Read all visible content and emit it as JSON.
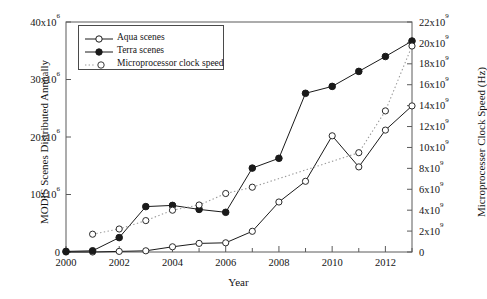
{
  "chart_data": {
    "type": "line",
    "title": "",
    "xlabel": "Year",
    "ylabel": "MODIS Scenes Distributed Annually",
    "ylabel_right": "Microprocesser Clock Speed (Hz)",
    "x": [
      2000,
      2001,
      2002,
      2003,
      2004,
      2005,
      2006,
      2007,
      2008,
      2009,
      2010,
      2011,
      2012,
      2013
    ],
    "xlim": [
      2000,
      2013
    ],
    "xticks": [
      2000,
      2002,
      2004,
      2006,
      2008,
      2010,
      2012
    ],
    "xticklabels": [
      "2000",
      "2002",
      "2004",
      "2006",
      "2008",
      "2010",
      "2012"
    ],
    "xminorticks": [
      2001,
      2003,
      2005,
      2007,
      2009,
      2011,
      2013
    ],
    "ylim": [
      0,
      40000000
    ],
    "yticks": [
      0,
      10000000,
      20000000,
      30000000,
      40000000
    ],
    "yticklabels": [
      "0",
      "10x10",
      "20x10",
      "30x10",
      "40x10"
    ],
    "ytick_exponent": "6",
    "ylim_right": [
      0,
      22000000000
    ],
    "yticks_right": [
      0,
      2000000000,
      4000000000,
      6000000000,
      8000000000,
      10000000000,
      12000000000,
      14000000000,
      16000000000,
      18000000000,
      20000000000,
      22000000000
    ],
    "yticklabels_right": [
      "0",
      "2x10",
      "4x10",
      "6x10",
      "8x10",
      "10x10",
      "12x10",
      "14x10",
      "16x10",
      "18x10",
      "20x10",
      "22x10"
    ],
    "ytick_right_exponent": "9",
    "grid": false,
    "legend_position": "upper left",
    "series": [
      {
        "name": "Aqua scenes",
        "axis": "left",
        "marker": "open-circle",
        "linestyle": "solid",
        "color": "#1a1a1a",
        "x": [
          2000,
          2001,
          2002,
          2003,
          2004,
          2005,
          2006,
          2007,
          2008,
          2009,
          2010,
          2011,
          2012,
          2013
        ],
        "values": [
          0,
          0,
          100000,
          200000,
          900000,
          1500000,
          1600000,
          3600000,
          8700000,
          12300000,
          20200000,
          14800000,
          21200000,
          25400000
        ]
      },
      {
        "name": "Terra scenes",
        "axis": "left",
        "marker": "filled-circle",
        "linestyle": "solid",
        "color": "#1a1a1a",
        "x": [
          2000,
          2001,
          2002,
          2003,
          2004,
          2005,
          2006,
          2007,
          2008,
          2009,
          2010,
          2011,
          2012,
          2013
        ],
        "values": [
          100000,
          200000,
          2500000,
          7900000,
          8100000,
          7400000,
          6900000,
          14600000,
          16300000,
          27600000,
          28800000,
          31400000,
          34000000,
          36700000
        ]
      },
      {
        "name": "Microprocessor clock speed",
        "axis": "right",
        "marker": "open-circle",
        "linestyle": "dotted",
        "color": "#9a9a9a",
        "x": [
          2001,
          2002,
          2003,
          2004,
          2005,
          2006,
          2007,
          2011,
          2012,
          2013
        ],
        "values": [
          1700000000,
          2200000000,
          3000000000,
          4000000000,
          4500000000,
          5600000000,
          6200000000,
          9500000000,
          13500000000,
          19700000000
        ]
      }
    ],
    "legend": [
      {
        "label": "Aqua scenes",
        "marker": "open-circle",
        "linestyle": "solid"
      },
      {
        "label": "Terra scenes",
        "marker": "filled-circle",
        "linestyle": "solid"
      },
      {
        "label": "Microprocessor clock speed",
        "marker": "open-circle",
        "linestyle": "dotted"
      }
    ]
  }
}
